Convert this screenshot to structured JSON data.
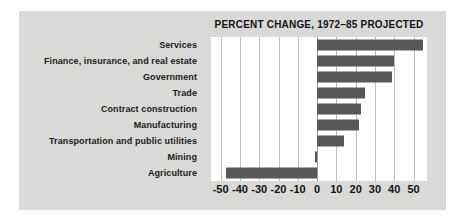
{
  "chart_data": {
    "type": "bar",
    "orientation": "horizontal",
    "title": "PERCENT CHANGE, 1972–85 PROJECTED",
    "xlabel": "",
    "ylabel": "",
    "xlim": [
      -55,
      57
    ],
    "xticks": [
      -50,
      -40,
      -30,
      -20,
      -10,
      0,
      10,
      20,
      30,
      40,
      50
    ],
    "xtick_labels": [
      "-50",
      "-40",
      "-30",
      "-20",
      "-10",
      "0",
      "10",
      "20",
      "30",
      "40",
      "50"
    ],
    "grid": true,
    "legend": false,
    "bar_color": "#585858",
    "plot_background": "#ffffff",
    "figure_background": "#d9d9d7",
    "categories": [
      "Services",
      "Finance, insurance, and real estate",
      "Government",
      "Trade",
      "Contract construction",
      "Manufacturing",
      "Transportation and public utilities",
      "Mining",
      "Agriculture"
    ],
    "values": [
      55,
      40,
      39,
      25,
      23,
      22,
      14,
      -1,
      -47
    ]
  }
}
